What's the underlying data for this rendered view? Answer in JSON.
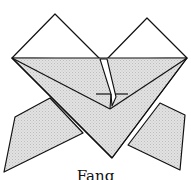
{
  "diagram": {
    "title": "Fang",
    "colors": {
      "stroke": "#111111",
      "fill_shaded": "#d9d9d9",
      "fill_paper": "#ffffff"
    }
  }
}
